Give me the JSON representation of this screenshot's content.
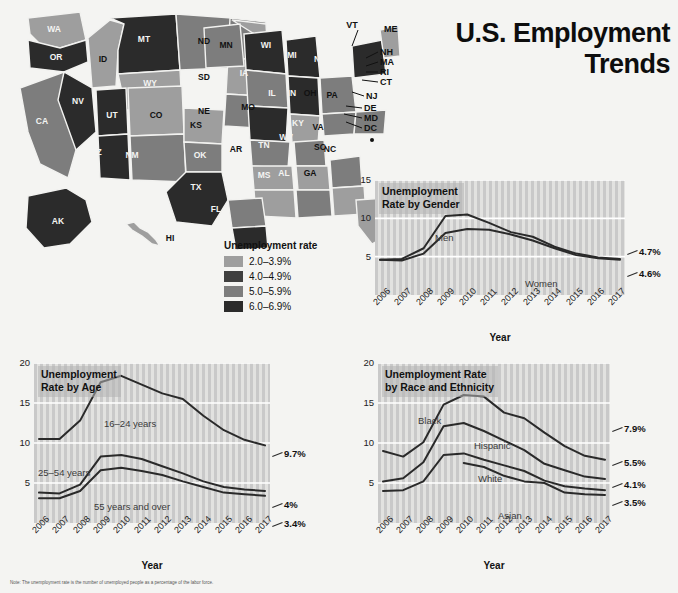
{
  "title": {
    "line1": "U.S. Employment",
    "line2": "Trends"
  },
  "map": {
    "legend_title": "Unemployment rate",
    "legend": [
      {
        "label": "2.0–3.9%",
        "color": "#9e9e9e"
      },
      {
        "label": "4.0–4.9%",
        "color": "#3f3f3f"
      },
      {
        "label": "5.0–5.9%",
        "color": "#7d7d7d"
      },
      {
        "label": "6.0–6.9%",
        "color": "#2b2b2b"
      }
    ],
    "state_labels": [
      "WA",
      "OR",
      "ID",
      "MT",
      "ND",
      "MN",
      "WI",
      "MI",
      "NY",
      "VT",
      "ME",
      "NH",
      "MA",
      "RI",
      "CT",
      "NJ",
      "DE",
      "MD",
      "DC",
      "PA",
      "OH",
      "IN",
      "IL",
      "IA",
      "SD",
      "NE",
      "WY",
      "NV",
      "CA",
      "UT",
      "CO",
      "KS",
      "MO",
      "KY",
      "WV",
      "VA",
      "NC",
      "SC",
      "GA",
      "FL",
      "AL",
      "MS",
      "TN",
      "AR",
      "LA",
      "TX",
      "OK",
      "NM",
      "AZ",
      "AK",
      "HI"
    ]
  },
  "chart_data": [
    {
      "id": "gender",
      "type": "line",
      "title": "Unemployment\nRate by Gender",
      "title_l1": "Unemployment",
      "title_l2": "Rate by Gender",
      "xlabel": "Year",
      "ylabel": "",
      "ylim": [
        0,
        15
      ],
      "yticks": [
        5,
        10,
        15
      ],
      "grid": true,
      "legend_position": "inline",
      "categories": [
        "2006",
        "2007",
        "2008",
        "2009",
        "2010",
        "2011",
        "2012",
        "2013",
        "2014",
        "2015",
        "2016",
        "2017"
      ],
      "series": [
        {
          "name": "Men",
          "values": [
            4.6,
            4.7,
            6.1,
            10.3,
            10.5,
            9.4,
            8.2,
            7.6,
            6.3,
            5.4,
            4.9,
            4.7
          ],
          "end_label": "4.7%"
        },
        {
          "name": "Women",
          "values": [
            4.6,
            4.5,
            5.4,
            8.1,
            8.6,
            8.5,
            7.9,
            7.1,
            6.1,
            5.2,
            4.8,
            4.6
          ],
          "end_label": "4.6%"
        }
      ]
    },
    {
      "id": "age",
      "type": "line",
      "title": "Unemployment\nRate by Age",
      "title_l1": "Unemployment",
      "title_l2": "Rate by Age",
      "xlabel": "Year",
      "ylabel": "",
      "ylim": [
        0,
        20
      ],
      "yticks": [
        5,
        10,
        15,
        20
      ],
      "grid": true,
      "legend_position": "inline",
      "categories": [
        "2006",
        "2007",
        "2008",
        "2009",
        "2010",
        "2011",
        "2012",
        "2013",
        "2014",
        "2015",
        "2016",
        "2017"
      ],
      "series": [
        {
          "name": "16–24 years",
          "values": [
            10.5,
            10.5,
            12.8,
            17.6,
            18.4,
            17.3,
            16.2,
            15.5,
            13.4,
            11.6,
            10.4,
            9.7
          ],
          "end_label": "9.7%"
        },
        {
          "name": "25–54 years",
          "values": [
            3.8,
            3.7,
            4.8,
            8.3,
            8.5,
            8.0,
            7.1,
            6.2,
            5.2,
            4.5,
            4.2,
            4.0
          ],
          "end_label": "4%"
        },
        {
          "name": "55 years and over",
          "values": [
            3.1,
            3.1,
            4.0,
            6.6,
            6.9,
            6.5,
            6.0,
            5.2,
            4.5,
            3.8,
            3.6,
            3.4
          ],
          "end_label": "3.4%"
        }
      ]
    },
    {
      "id": "race",
      "type": "line",
      "title": "Unemployment Rate\nby Race and Ethnicity",
      "title_l1": "Unemployment Rate",
      "title_l2": "by Race and Ethnicity",
      "xlabel": "Year",
      "ylabel": "",
      "ylim": [
        0,
        20
      ],
      "yticks": [
        5,
        10,
        15,
        20
      ],
      "grid": true,
      "legend_position": "inline",
      "categories": [
        "2006",
        "2007",
        "2008",
        "2009",
        "2010",
        "2011",
        "2012",
        "2013",
        "2014",
        "2015",
        "2016",
        "2017"
      ],
      "series": [
        {
          "name": "Black",
          "values": [
            9.0,
            8.3,
            10.1,
            14.8,
            16.0,
            15.8,
            13.8,
            13.1,
            11.3,
            9.6,
            8.4,
            7.9
          ],
          "end_label": "7.9%"
        },
        {
          "name": "Hispanic",
          "values": [
            5.2,
            5.6,
            7.6,
            12.1,
            12.5,
            11.5,
            10.3,
            9.1,
            7.4,
            6.6,
            5.8,
            5.5
          ],
          "end_label": "5.5%"
        },
        {
          "name": "White",
          "values": [
            4.0,
            4.1,
            5.2,
            8.5,
            8.7,
            7.9,
            7.2,
            6.5,
            5.3,
            4.6,
            4.3,
            4.1
          ],
          "end_label": "4.1%"
        },
        {
          "name": "Asian",
          "values": [
            null,
            null,
            null,
            null,
            7.5,
            7.0,
            5.9,
            5.2,
            5.0,
            3.8,
            3.6,
            3.5
          ],
          "end_label": "3.5%"
        }
      ]
    }
  ],
  "note": "Note: The unemployment rate is the number of unemployed people as a percentage of the labor force."
}
